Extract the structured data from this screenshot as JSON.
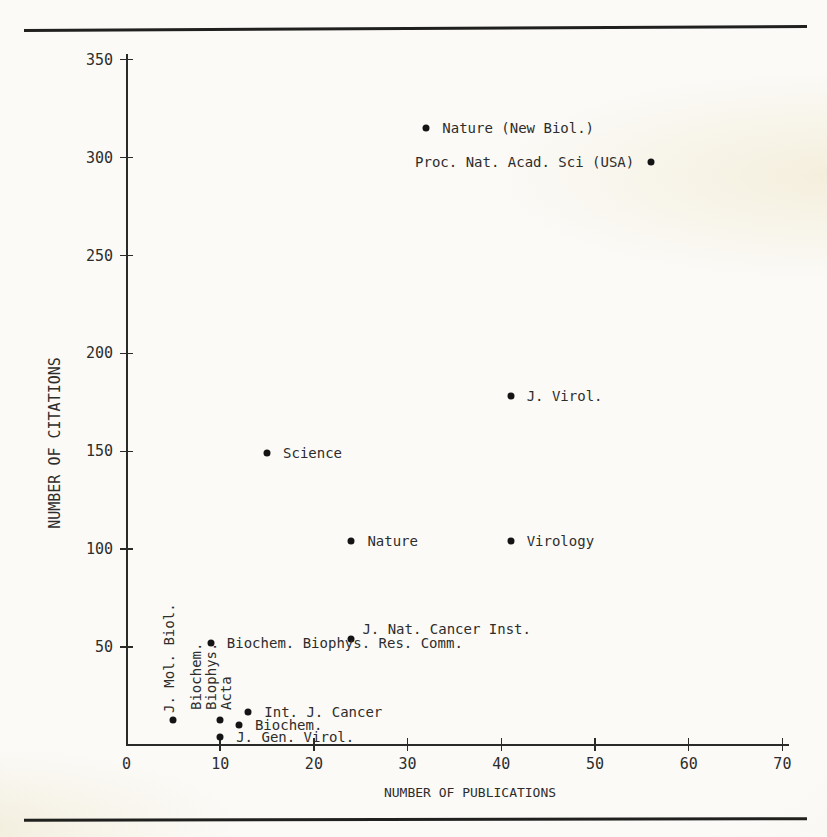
{
  "colors": {
    "ink": "#2d2d2c",
    "dot": "#141414",
    "paper": "#fbfaf7",
    "paper_edge": "#edebe1",
    "rule": "#20201e"
  },
  "chart_data": {
    "type": "scatter",
    "title": "",
    "xlabel": "NUMBER OF PUBLICATIONS",
    "ylabel": "NUMBER OF CITATIONS",
    "xlim": [
      0,
      70
    ],
    "ylim": [
      0,
      350
    ],
    "x_ticks": [
      0,
      10,
      20,
      30,
      40,
      50,
      60,
      70
    ],
    "y_ticks": [
      50,
      100,
      150,
      200,
      250,
      300,
      350
    ],
    "grid": false,
    "legend": false,
    "points": [
      {
        "label": "Nature (New Biol.)",
        "x": 32,
        "y": 315,
        "label_placement": "right"
      },
      {
        "label": "Proc. Nat. Acad. Sci (USA)",
        "x": 56,
        "y": 298,
        "label_placement": "left"
      },
      {
        "label": "J. Virol.",
        "x": 41,
        "y": 178,
        "label_placement": "right"
      },
      {
        "label": "Science",
        "x": 15,
        "y": 149,
        "label_placement": "right"
      },
      {
        "label": "Nature",
        "x": 24,
        "y": 104,
        "label_placement": "right"
      },
      {
        "label": "Virology",
        "x": 41,
        "y": 104,
        "label_placement": "right"
      },
      {
        "label": "J. Nat. Cancer Inst.",
        "x": 24,
        "y": 54,
        "label_placement": "above-right"
      },
      {
        "label": "Biochem. Biophys. Res. Comm.",
        "x": 9,
        "y": 52,
        "label_placement": "right"
      },
      {
        "label": "Int. J. Cancer",
        "x": 13,
        "y": 17,
        "label_placement": "right"
      },
      {
        "label": "Biochem.",
        "x": 12,
        "y": 10,
        "label_placement": "right"
      },
      {
        "label": "J. Gen. Virol.",
        "x": 10,
        "y": 4,
        "label_placement": "right"
      },
      {
        "label": "J. Mol. Biol.",
        "x": 5,
        "y": 13,
        "label_placement": "rotated-above",
        "label_lines": [
          "J. Mol. Biol."
        ]
      },
      {
        "label": "Biochem. Biophys. Acta",
        "x": 10,
        "y": 13,
        "label_placement": "rotated-above",
        "label_lines": [
          "Biochem.",
          "Biophys.",
          "Acta"
        ]
      }
    ]
  }
}
